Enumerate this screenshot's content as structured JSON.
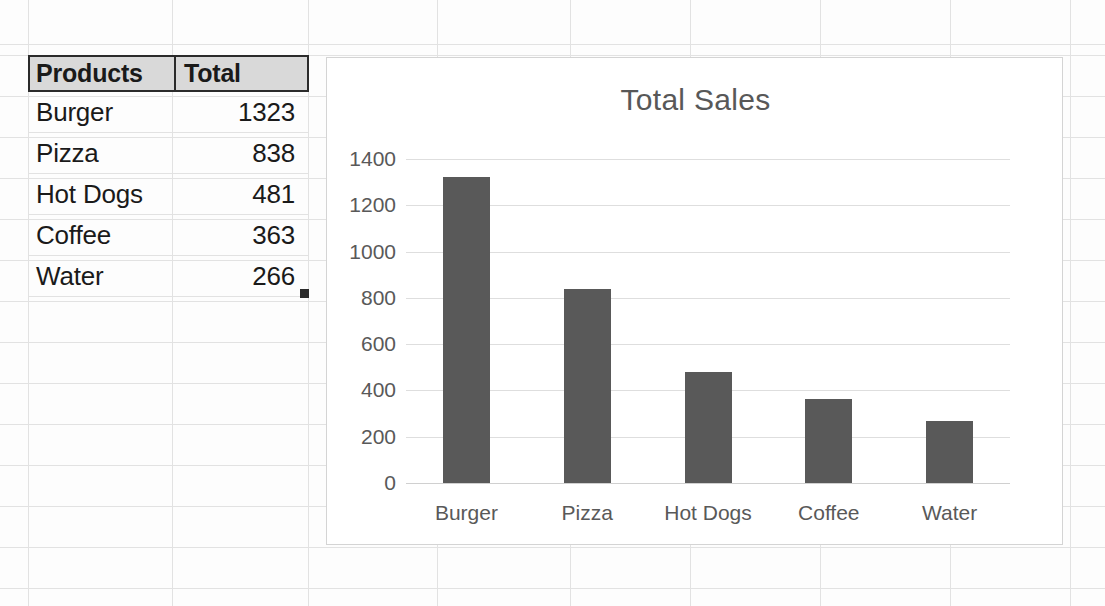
{
  "sheet": {
    "table": {
      "headers": [
        "Products",
        "Total"
      ],
      "rows": [
        {
          "product": "Burger",
          "total": "1323"
        },
        {
          "product": "Pizza",
          "total": "838"
        },
        {
          "product": "Hot Dogs",
          "total": "481"
        },
        {
          "product": "Coffee",
          "total": "363"
        },
        {
          "product": "Water",
          "total": "266"
        }
      ]
    }
  },
  "chart_data": {
    "type": "bar",
    "title": "Total Sales",
    "xlabel": "",
    "ylabel": "",
    "categories": [
      "Burger",
      "Pizza",
      "Hot Dogs",
      "Coffee",
      "Water"
    ],
    "values": [
      1323,
      838,
      481,
      363,
      266
    ],
    "yticks": [
      1400,
      1200,
      1000,
      800,
      600,
      400,
      200,
      0
    ],
    "ylim": [
      0,
      1400
    ],
    "grid": true,
    "legend": false,
    "series_color": "#595959"
  },
  "colors": {
    "bar": "#595959",
    "header_fill": "#d9d9d9",
    "header_border": "#2b2b2b",
    "gridline": "#e2e2e2",
    "chart_border": "#d4d4d4",
    "text": "#1a1a1a",
    "chart_text": "#595959"
  }
}
